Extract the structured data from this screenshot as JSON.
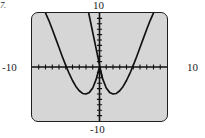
{
  "figure": {
    "number_label": "7."
  },
  "screen": {
    "background_color": "#d6d6d6",
    "border_color": "#1e1e1e",
    "curve_color": "#111111"
  },
  "window_labels": {
    "ymax": "10",
    "ymin": "-10",
    "xmin": "-10",
    "xmax": "10"
  },
  "chart_data": {
    "type": "line",
    "title": "",
    "xlabel": "",
    "ylabel": "",
    "xlim": [
      -10,
      10
    ],
    "ylim": [
      -10,
      10
    ],
    "grid": false,
    "legend": "none",
    "axis_ticks": {
      "x_tick_interval": 1,
      "y_tick_interval": 1,
      "x_ticks": [
        -9,
        -8,
        -7,
        -6,
        -5,
        -4,
        -3,
        -2,
        -1,
        1,
        2,
        3,
        4,
        5,
        6,
        7,
        8,
        9
      ],
      "y_ticks": [
        -9,
        -8,
        -7,
        -6,
        -5,
        -4,
        -3,
        -2,
        -1,
        1,
        2,
        3,
        4,
        5,
        6,
        7,
        8,
        9
      ]
    },
    "annotations": [
      {
        "text": "10",
        "position": "top",
        "axis": "y"
      },
      {
        "text": "-10",
        "position": "bottom",
        "axis": "y"
      },
      {
        "text": "-10",
        "position": "left",
        "axis": "x"
      },
      {
        "text": "10",
        "position": "right",
        "axis": "x"
      }
    ],
    "series": [
      {
        "name": "quartic-w-curve",
        "type": "line",
        "color": "#111111",
        "description": "W-shaped quartic with two minima below the x-axis and a local maximum at the origin",
        "x": [
          -8.0,
          -7.5,
          -7.0,
          -6.5,
          -6.0,
          -5.5,
          -5.0,
          -4.5,
          -4.0,
          -3.5,
          -3.0,
          -2.5,
          -2.0,
          -1.5,
          -1.0,
          -0.5,
          0.0,
          0.5,
          1.0,
          1.5,
          2.0,
          2.5,
          3.0,
          3.5,
          4.0,
          4.5,
          5.0,
          5.5,
          6.0,
          6.5,
          7.0,
          7.5,
          8.0
        ],
        "y": [
          10.0,
          8.6,
          7.0,
          5.3,
          3.6,
          1.9,
          0.3,
          -1.2,
          -2.5,
          -3.6,
          -4.4,
          -4.9,
          -5.0,
          -4.7,
          -3.9,
          -2.3,
          0.0,
          -2.3,
          -3.9,
          -4.7,
          -5.0,
          -4.9,
          -4.4,
          -3.6,
          -2.5,
          -1.2,
          0.3,
          1.9,
          3.6,
          5.3,
          7.0,
          8.6,
          10.0
        ]
      },
      {
        "name": "steep-line",
        "type": "line",
        "color": "#111111",
        "description": "Steeply decreasing straight line crossing near the origin",
        "x": [
          -1.6,
          0.4
        ],
        "y": [
          10.0,
          -2.0
        ]
      }
    ]
  }
}
